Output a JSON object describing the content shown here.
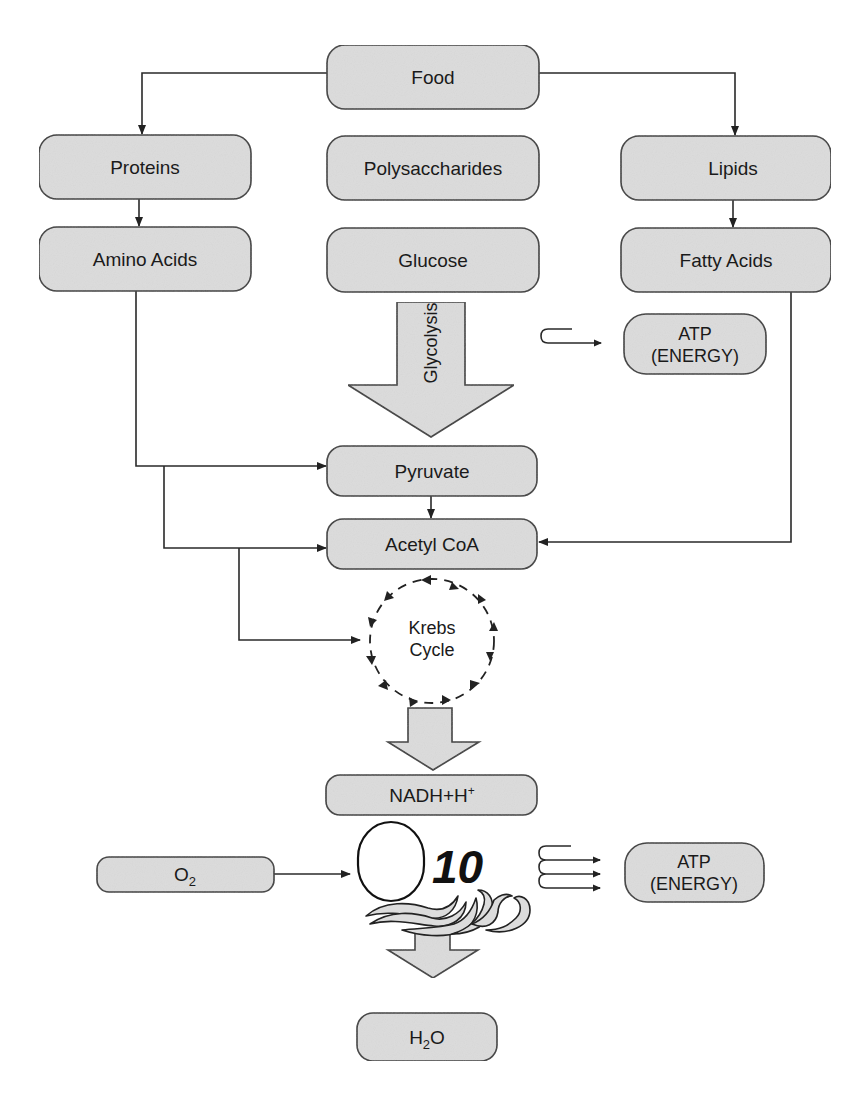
{
  "colors": {
    "box_fill": "#dcdcdc",
    "box_stroke": "#3a3a3a",
    "line": "#2a2a2a",
    "background": "#ffffff"
  },
  "nodes": {
    "food": "Food",
    "proteins": "Proteins",
    "polysaccharides": "Polysaccharides",
    "lipids": "Lipids",
    "amino_acids": "Amino Acids",
    "glucose": "Glucose",
    "fatty_acids": "Fatty Acids",
    "atp_1_line1": "ATP",
    "atp_1_line2": "(ENERGY)",
    "pyruvate": "Pyruvate",
    "acetyl_coa": "Acetyl CoA",
    "krebs_line1": "Krebs",
    "krebs_line2": "Cycle",
    "nadh": "NADH+H",
    "nadh_sup": "+",
    "o2": "O",
    "o2_sub": "2",
    "atp_2_line1": "ATP",
    "atp_2_line2": "(ENERGY)",
    "h2o_h": "H",
    "h2o_sub": "2",
    "h2o_o": "O"
  },
  "arrows": {
    "glycolysis_label": "Glycolysis"
  },
  "electron_transport": {
    "label": "10"
  }
}
